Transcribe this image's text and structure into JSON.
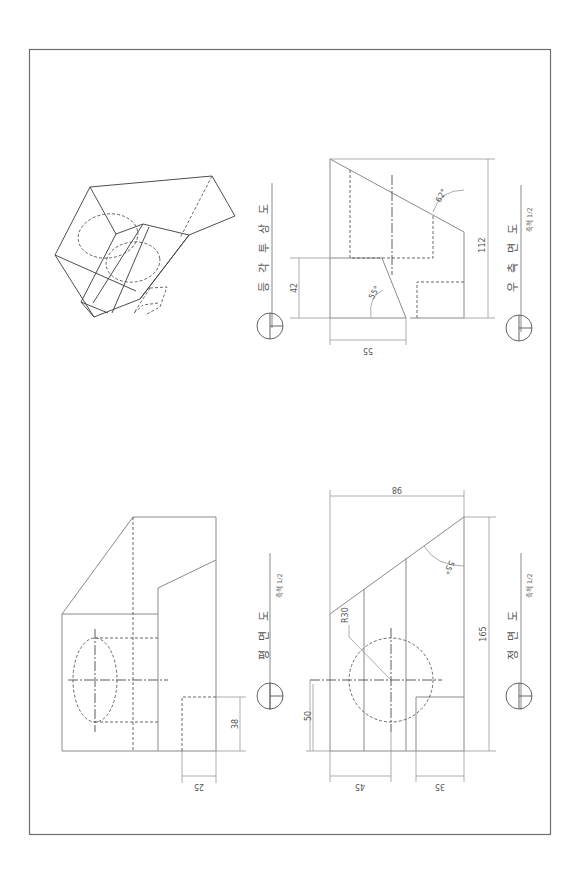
{
  "views": {
    "isometric": {
      "title": "등 각 투 상 도"
    },
    "plan": {
      "title": "평 면 도",
      "scale": "축척 1/2",
      "dims": {
        "d38": "38",
        "d25": "25"
      }
    },
    "front": {
      "title": "정 면 도",
      "scale": "축척 1/2",
      "dims": {
        "d98": "98",
        "d165": "165",
        "d50": "50",
        "d45": "45",
        "d35": "35",
        "r30": "R30",
        "a55": "55°"
      }
    },
    "right": {
      "title": "우 측 면 도",
      "scale": "축척 1/2",
      "dims": {
        "d42": "42",
        "d55": "55",
        "d112": "112",
        "a55": "55°",
        "a62": "62°"
      }
    }
  },
  "colors": {
    "frame": "#6e6e6e",
    "line": "#8a8a8a",
    "text": "#555555"
  }
}
